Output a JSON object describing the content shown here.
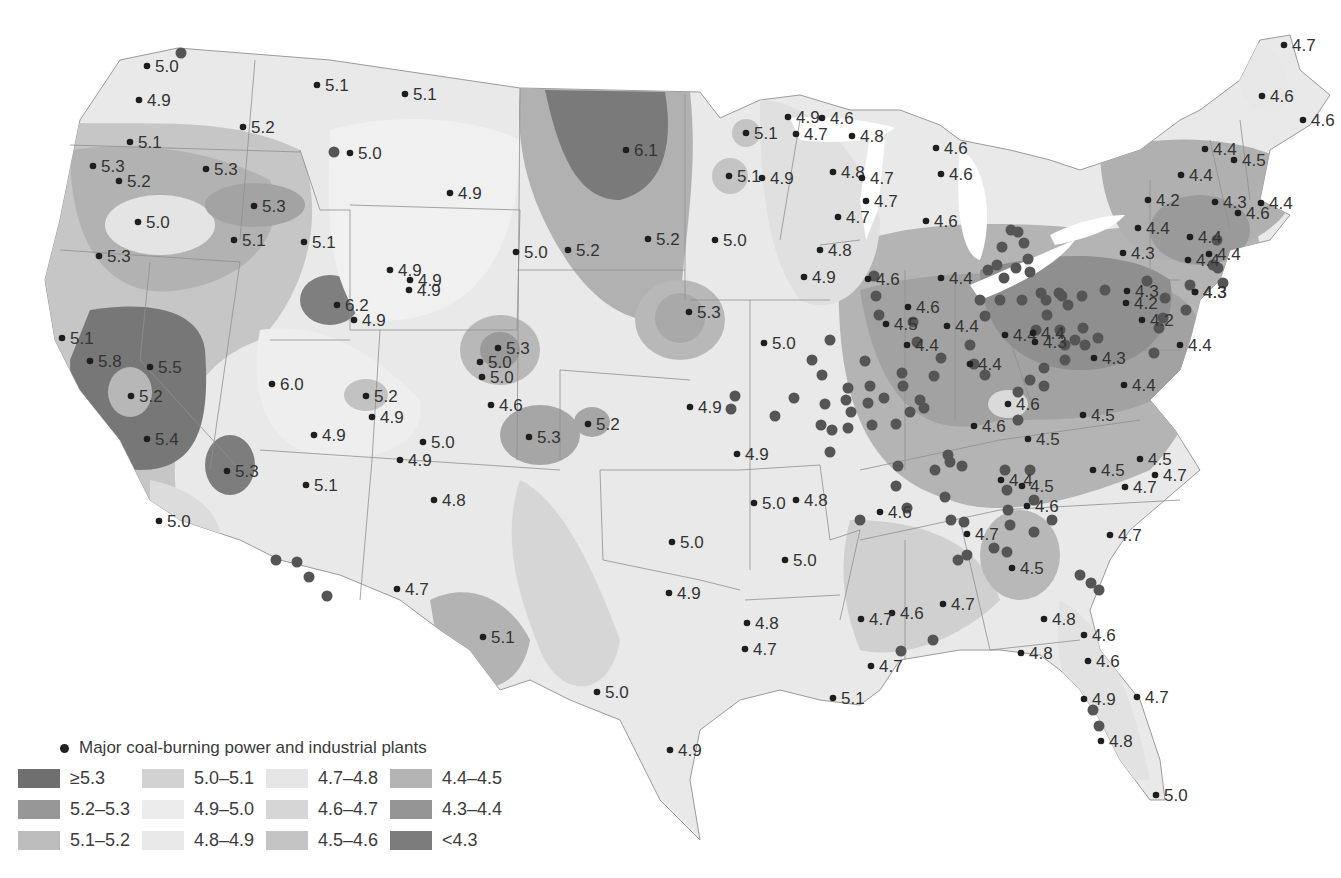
{
  "map": {
    "type": "choropleth-contour",
    "subject": "Precipitation pH contours over contiguous United States",
    "background": "#ffffff",
    "state_line_color": "#8a8a8a"
  },
  "legend": {
    "plants_label": "Major coal-burning power and industrial plants",
    "classes": [
      {
        "label": "≥5.3",
        "color": "#6f6f6f"
      },
      {
        "label": "5.0–5.1",
        "color": "#d2d2d2"
      },
      {
        "label": "4.7–4.8",
        "color": "#e6e6e6"
      },
      {
        "label": "4.4–4.5",
        "color": "#b4b4b4"
      },
      {
        "label": "5.2–5.3",
        "color": "#979797"
      },
      {
        "label": "4.9–5.0",
        "color": "#ececec"
      },
      {
        "label": "4.6–4.7",
        "color": "#d6d6d6"
      },
      {
        "label": "4.3–4.4",
        "color": "#959595"
      },
      {
        "label": "5.1–5.2",
        "color": "#bdbdbd"
      },
      {
        "label": "4.8–4.9",
        "color": "#e9e9e9"
      },
      {
        "label": "4.5–4.6",
        "color": "#c4c4c4"
      },
      {
        "label": "<4.3",
        "color": "#7c7c7c"
      }
    ]
  },
  "chart_data": {
    "type": "map",
    "title": "",
    "legend_position": "bottom-left",
    "classes": [
      "≥5.3",
      "5.2–5.3",
      "5.1–5.2",
      "5.0–5.1",
      "4.9–5.0",
      "4.8–4.9",
      "4.7–4.8",
      "4.6–4.7",
      "4.5–4.6",
      "4.4–4.5",
      "4.3–4.4",
      "<4.3"
    ],
    "stations": [
      {
        "x": 147,
        "y": 66,
        "v": "5.0"
      },
      {
        "x": 139,
        "y": 100,
        "v": "4.9"
      },
      {
        "x": 130,
        "y": 142,
        "v": "5.1"
      },
      {
        "x": 93,
        "y": 166,
        "v": "5.3"
      },
      {
        "x": 119,
        "y": 181,
        "v": "5.2"
      },
      {
        "x": 138,
        "y": 222,
        "v": "5.0"
      },
      {
        "x": 99,
        "y": 256,
        "v": "5.3"
      },
      {
        "x": 243,
        "y": 127,
        "v": "5.2"
      },
      {
        "x": 206,
        "y": 169,
        "v": "5.3"
      },
      {
        "x": 254,
        "y": 206,
        "v": "5.3"
      },
      {
        "x": 234,
        "y": 240,
        "v": "5.1"
      },
      {
        "x": 304,
        "y": 242,
        "v": "5.1"
      },
      {
        "x": 317,
        "y": 85,
        "v": "5.1"
      },
      {
        "x": 405,
        "y": 94,
        "v": "5.1"
      },
      {
        "x": 350,
        "y": 153,
        "v": "5.0"
      },
      {
        "x": 450,
        "y": 193,
        "v": "4.9"
      },
      {
        "x": 390,
        "y": 270,
        "v": "4.9"
      },
      {
        "x": 410,
        "y": 280,
        "v": "4.9"
      },
      {
        "x": 409,
        "y": 290,
        "v": "4.9"
      },
      {
        "x": 337,
        "y": 305,
        "v": "6.2"
      },
      {
        "x": 354,
        "y": 320,
        "v": "4.9"
      },
      {
        "x": 62,
        "y": 338,
        "v": "5.1"
      },
      {
        "x": 90,
        "y": 361,
        "v": "5.8"
      },
      {
        "x": 150,
        "y": 367,
        "v": "5.5"
      },
      {
        "x": 131,
        "y": 396,
        "v": "5.2"
      },
      {
        "x": 147,
        "y": 439,
        "v": "5.4"
      },
      {
        "x": 227,
        "y": 471,
        "v": "5.3"
      },
      {
        "x": 159,
        "y": 521,
        "v": "5.0"
      },
      {
        "x": 272,
        "y": 384,
        "v": "6.0"
      },
      {
        "x": 366,
        "y": 396,
        "v": "5.2"
      },
      {
        "x": 372,
        "y": 417,
        "v": "4.9"
      },
      {
        "x": 314,
        "y": 435,
        "v": "4.9"
      },
      {
        "x": 423,
        "y": 442,
        "v": "5.0"
      },
      {
        "x": 400,
        "y": 460,
        "v": "4.9"
      },
      {
        "x": 306,
        "y": 485,
        "v": "5.1"
      },
      {
        "x": 434,
        "y": 500,
        "v": "4.8"
      },
      {
        "x": 397,
        "y": 589,
        "v": "4.7"
      },
      {
        "x": 516,
        "y": 252,
        "v": "5.0"
      },
      {
        "x": 568,
        "y": 250,
        "v": "5.2"
      },
      {
        "x": 626,
        "y": 150,
        "v": "6.1"
      },
      {
        "x": 648,
        "y": 239,
        "v": "5.2"
      },
      {
        "x": 498,
        "y": 348,
        "v": "5.3"
      },
      {
        "x": 480,
        "y": 362,
        "v": "5.0"
      },
      {
        "x": 482,
        "y": 377,
        "v": "5.0"
      },
      {
        "x": 491,
        "y": 405,
        "v": "4.6"
      },
      {
        "x": 529,
        "y": 437,
        "v": "5.3"
      },
      {
        "x": 588,
        "y": 424,
        "v": "5.2"
      },
      {
        "x": 483,
        "y": 637,
        "v": "5.1"
      },
      {
        "x": 597,
        "y": 692,
        "v": "5.0"
      },
      {
        "x": 670,
        "y": 750,
        "v": "4.9"
      },
      {
        "x": 669,
        "y": 593,
        "v": "4.9"
      },
      {
        "x": 672,
        "y": 542,
        "v": "5.0"
      },
      {
        "x": 689,
        "y": 312,
        "v": "5.3"
      },
      {
        "x": 764,
        "y": 343,
        "v": "5.0"
      },
      {
        "x": 690,
        "y": 407,
        "v": "4.9"
      },
      {
        "x": 737,
        "y": 454,
        "v": "4.9"
      },
      {
        "x": 754,
        "y": 503,
        "v": "5.0"
      },
      {
        "x": 796,
        "y": 500,
        "v": "4.8"
      },
      {
        "x": 785,
        "y": 560,
        "v": "5.0"
      },
      {
        "x": 747,
        "y": 623,
        "v": "4.8"
      },
      {
        "x": 745,
        "y": 649,
        "v": "4.7"
      },
      {
        "x": 833,
        "y": 698,
        "v": "5.1"
      },
      {
        "x": 715,
        "y": 240,
        "v": "5.0"
      },
      {
        "x": 729,
        "y": 176,
        "v": "5.1"
      },
      {
        "x": 746,
        "y": 133,
        "v": "5.1"
      },
      {
        "x": 762,
        "y": 178,
        "v": "4.9"
      },
      {
        "x": 788,
        "y": 117,
        "v": "4.9"
      },
      {
        "x": 796,
        "y": 134,
        "v": "4.7"
      },
      {
        "x": 822,
        "y": 118,
        "v": "4.6"
      },
      {
        "x": 852,
        "y": 136,
        "v": "4.8"
      },
      {
        "x": 833,
        "y": 172,
        "v": "4.8"
      },
      {
        "x": 862,
        "y": 178,
        "v": "4.7"
      },
      {
        "x": 866,
        "y": 201,
        "v": "4.7"
      },
      {
        "x": 838,
        "y": 217,
        "v": "4.7"
      },
      {
        "x": 820,
        "y": 250,
        "v": "4.8"
      },
      {
        "x": 804,
        "y": 277,
        "v": "4.9"
      },
      {
        "x": 936,
        "y": 148,
        "v": "4.6"
      },
      {
        "x": 941,
        "y": 174,
        "v": "4.6"
      },
      {
        "x": 926,
        "y": 221,
        "v": "4.6"
      },
      {
        "x": 941,
        "y": 278,
        "v": "4.4"
      },
      {
        "x": 868,
        "y": 279,
        "v": "4.6"
      },
      {
        "x": 908,
        "y": 307,
        "v": "4.6"
      },
      {
        "x": 886,
        "y": 324,
        "v": "4.5"
      },
      {
        "x": 947,
        "y": 326,
        "v": "4.4"
      },
      {
        "x": 1005,
        "y": 335,
        "v": "4.4"
      },
      {
        "x": 1033,
        "y": 333,
        "v": "4.4"
      },
      {
        "x": 1035,
        "y": 342,
        "v": "4.3"
      },
      {
        "x": 907,
        "y": 345,
        "v": "4.4"
      },
      {
        "x": 970,
        "y": 364,
        "v": "4.4"
      },
      {
        "x": 1008,
        "y": 404,
        "v": "4.6"
      },
      {
        "x": 974,
        "y": 426,
        "v": "4.6"
      },
      {
        "x": 1028,
        "y": 439,
        "v": "4.5"
      },
      {
        "x": 1083,
        "y": 415,
        "v": "4.5"
      },
      {
        "x": 1124,
        "y": 385,
        "v": "4.4"
      },
      {
        "x": 1094,
        "y": 358,
        "v": "4.3"
      },
      {
        "x": 1142,
        "y": 320,
        "v": "4.2"
      },
      {
        "x": 1127,
        "y": 291,
        "v": "4.3"
      },
      {
        "x": 1126,
        "y": 303,
        "v": "4.2"
      },
      {
        "x": 1180,
        "y": 345,
        "v": "4.4"
      },
      {
        "x": 1195,
        "y": 292,
        "v": "4.3"
      },
      {
        "x": 1001,
        "y": 480,
        "v": "4.4"
      },
      {
        "x": 1022,
        "y": 486,
        "v": "4.5"
      },
      {
        "x": 1027,
        "y": 506,
        "v": "4.6"
      },
      {
        "x": 1093,
        "y": 470,
        "v": "4.5"
      },
      {
        "x": 1140,
        "y": 459,
        "v": "4.5"
      },
      {
        "x": 1155,
        "y": 475,
        "v": "4.7"
      },
      {
        "x": 1125,
        "y": 487,
        "v": "4.7"
      },
      {
        "x": 1110,
        "y": 535,
        "v": "4.7"
      },
      {
        "x": 1012,
        "y": 568,
        "v": "4.5"
      },
      {
        "x": 967,
        "y": 534,
        "v": "4.7"
      },
      {
        "x": 880,
        "y": 512,
        "v": "4.6"
      },
      {
        "x": 943,
        "y": 604,
        "v": "4.7"
      },
      {
        "x": 892,
        "y": 613,
        "v": "4.6"
      },
      {
        "x": 861,
        "y": 619,
        "v": "4.7"
      },
      {
        "x": 871,
        "y": 666,
        "v": "4.7"
      },
      {
        "x": 1044,
        "y": 619,
        "v": "4.8"
      },
      {
        "x": 1021,
        "y": 653,
        "v": "4.8"
      },
      {
        "x": 1084,
        "y": 635,
        "v": "4.6"
      },
      {
        "x": 1088,
        "y": 661,
        "v": "4.6"
      },
      {
        "x": 1084,
        "y": 699,
        "v": "4.9"
      },
      {
        "x": 1137,
        "y": 697,
        "v": "4.7"
      },
      {
        "x": 1101,
        "y": 741,
        "v": "4.8"
      },
      {
        "x": 1156,
        "y": 795,
        "v": "5.0"
      },
      {
        "x": 1284,
        "y": 45,
        "v": "4.7"
      },
      {
        "x": 1262,
        "y": 96,
        "v": "4.6"
      },
      {
        "x": 1303,
        "y": 120,
        "v": "4.6"
      },
      {
        "x": 1205,
        "y": 149,
        "v": "4.4"
      },
      {
        "x": 1234,
        "y": 160,
        "v": "4.5"
      },
      {
        "x": 1181,
        "y": 175,
        "v": "4.4"
      },
      {
        "x": 1148,
        "y": 200,
        "v": "4.2"
      },
      {
        "x": 1215,
        "y": 202,
        "v": "4.3"
      },
      {
        "x": 1261,
        "y": 203,
        "v": "4.4"
      },
      {
        "x": 1238,
        "y": 213,
        "v": "4.6"
      },
      {
        "x": 1138,
        "y": 228,
        "v": "4.4"
      },
      {
        "x": 1190,
        "y": 237,
        "v": "4.4"
      },
      {
        "x": 1123,
        "y": 253,
        "v": "4.3"
      },
      {
        "x": 1188,
        "y": 260,
        "v": "4.4"
      },
      {
        "x": 1209,
        "y": 254,
        "v": "4.4"
      },
      {
        "x": 1195,
        "y": 292,
        "v": "4.3"
      }
    ],
    "plants": [
      [
        181,
        53
      ],
      [
        334,
        152
      ],
      [
        276,
        560
      ],
      [
        309,
        577
      ],
      [
        327,
        596
      ],
      [
        297,
        562
      ],
      [
        775,
        416
      ],
      [
        794,
        398
      ],
      [
        735,
        396
      ],
      [
        731,
        409
      ],
      [
        825,
        404
      ],
      [
        821,
        425
      ],
      [
        832,
        430
      ],
      [
        846,
        400
      ],
      [
        851,
        412
      ],
      [
        848,
        428
      ],
      [
        830,
        452
      ],
      [
        812,
        360
      ],
      [
        822,
        375
      ],
      [
        830,
        340
      ],
      [
        848,
        388
      ],
      [
        865,
        361
      ],
      [
        870,
        386
      ],
      [
        868,
        403
      ],
      [
        872,
        425
      ],
      [
        884,
        398
      ],
      [
        896,
        424
      ],
      [
        898,
        466
      ],
      [
        896,
        486
      ],
      [
        907,
        508
      ],
      [
        935,
        470
      ],
      [
        950,
        462
      ],
      [
        962,
        466
      ],
      [
        945,
        497
      ],
      [
        951,
        520
      ],
      [
        964,
        522
      ],
      [
        967,
        555
      ],
      [
        958,
        560
      ],
      [
        1007,
        490
      ],
      [
        1010,
        525
      ],
      [
        1007,
        552
      ],
      [
        994,
        548
      ],
      [
        933,
        640
      ],
      [
        901,
        651
      ],
      [
        860,
        520
      ],
      [
        903,
        386
      ],
      [
        902,
        373
      ],
      [
        874,
        276
      ],
      [
        876,
        296
      ],
      [
        879,
        315
      ],
      [
        913,
        322
      ],
      [
        917,
        342
      ],
      [
        934,
        376
      ],
      [
        941,
        358
      ],
      [
        920,
        400
      ],
      [
        924,
        408
      ],
      [
        910,
        412
      ],
      [
        970,
        345
      ],
      [
        974,
        364
      ],
      [
        985,
        375
      ],
      [
        985,
        316
      ],
      [
        988,
        270
      ],
      [
        1002,
        247
      ],
      [
        1011,
        230
      ],
      [
        1018,
        232
      ],
      [
        1028,
        259
      ],
      [
        1030,
        272
      ],
      [
        1004,
        278
      ],
      [
        1016,
        268
      ],
      [
        1041,
        293
      ],
      [
        1046,
        300
      ],
      [
        1059,
        293
      ],
      [
        1062,
        296
      ],
      [
        1068,
        305
      ],
      [
        1060,
        330
      ],
      [
        1075,
        340
      ],
      [
        1085,
        345
      ],
      [
        1065,
        360
      ],
      [
        1044,
        368
      ],
      [
        1030,
        380
      ],
      [
        1018,
        392
      ],
      [
        1105,
        290
      ],
      [
        1147,
        281
      ],
      [
        1190,
        285
      ],
      [
        1165,
        298
      ],
      [
        1163,
        318
      ],
      [
        1159,
        328
      ],
      [
        1154,
        353
      ],
      [
        1213,
        265
      ],
      [
        1217,
        240
      ],
      [
        1218,
        268
      ],
      [
        1223,
        283
      ],
      [
        1186,
        310
      ],
      [
        1018,
        420
      ],
      [
        1044,
        386
      ],
      [
        997,
        265
      ],
      [
        1024,
        243
      ],
      [
        980,
        300
      ],
      [
        1000,
        300
      ],
      [
        1022,
        300
      ],
      [
        1082,
        296
      ],
      [
        1083,
        328
      ],
      [
        1098,
        338
      ],
      [
        1047,
        315
      ],
      [
        1036,
        330
      ],
      [
        1065,
        345
      ],
      [
        948,
        455
      ],
      [
        1005,
        470
      ],
      [
        1030,
        470
      ],
      [
        1034,
        500
      ],
      [
        1052,
        520
      ],
      [
        1034,
        532
      ],
      [
        1008,
        510
      ],
      [
        1080,
        575
      ],
      [
        1091,
        583
      ],
      [
        1099,
        590
      ],
      [
        1093,
        710
      ],
      [
        1099,
        726
      ]
    ],
    "source_note": "Contour shading approximated"
  }
}
